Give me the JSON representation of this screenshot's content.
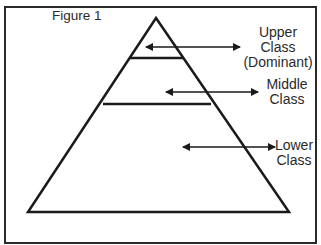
{
  "header": {
    "cut_title": "...y..."
  },
  "figure": {
    "label": "Figure 1",
    "colors": {
      "stroke": "#1a1a1a",
      "background": "#ffffff"
    },
    "classes": [
      {
        "line1": "Upper",
        "line2": "Class",
        "line3": "(Dominant)"
      },
      {
        "line1": "Middle",
        "line2": "Class"
      },
      {
        "line1": "Lower",
        "line2": "Class"
      }
    ]
  }
}
